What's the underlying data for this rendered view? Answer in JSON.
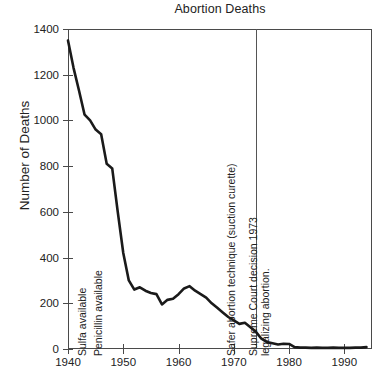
{
  "chart_data": {
    "type": "line",
    "title": "Abortion Deaths",
    "xlabel": "",
    "ylabel": "Number of Deaths",
    "xlim": [
      1940,
      1995
    ],
    "ylim": [
      0,
      1400
    ],
    "grid": false,
    "legend": "none",
    "x_ticks": [
      1940,
      1950,
      1960,
      1970,
      1980,
      1990
    ],
    "x_tick_labels": [
      "1940",
      "1950",
      "1960",
      "1970",
      "1980",
      "1990"
    ],
    "y_ticks": [
      0,
      200,
      400,
      600,
      800,
      1000,
      1200,
      1400
    ],
    "y_tick_labels": [
      "0",
      "200",
      "400",
      "600",
      "800",
      "1000",
      "1200",
      "1400"
    ],
    "series": [
      {
        "name": "Abortion deaths",
        "color": "#1a1a1a",
        "x": [
          1940,
          1941,
          1942,
          1943,
          1944,
          1945,
          1946,
          1947,
          1948,
          1949,
          1950,
          1951,
          1952,
          1953,
          1954,
          1955,
          1956,
          1957,
          1958,
          1959,
          1960,
          1961,
          1962,
          1963,
          1964,
          1965,
          1966,
          1967,
          1968,
          1969,
          1970,
          1971,
          1972,
          1973,
          1974,
          1975,
          1976,
          1977,
          1978,
          1979,
          1980,
          1981,
          1982,
          1983,
          1984,
          1985,
          1986,
          1987,
          1988,
          1989,
          1990,
          1991,
          1992,
          1993,
          1994
        ],
        "values": [
          1350,
          1230,
          1130,
          1025,
          1000,
          960,
          940,
          810,
          790,
          600,
          420,
          300,
          260,
          270,
          255,
          245,
          240,
          195,
          215,
          220,
          240,
          265,
          275,
          255,
          240,
          225,
          200,
          180,
          160,
          140,
          125,
          110,
          115,
          95,
          75,
          45,
          30,
          25,
          20,
          23,
          22,
          8,
          6,
          6,
          5,
          6,
          5,
          5,
          6,
          5,
          5,
          5,
          6,
          6,
          8
        ]
      }
    ],
    "annotations": [
      {
        "id": "sulfa",
        "text": "Sulfa available",
        "x_year": 1943,
        "orientation": "vertical"
      },
      {
        "id": "penicillin",
        "text": "Penicillin available",
        "x_year": 1946,
        "orientation": "vertical"
      },
      {
        "id": "suction-curette",
        "text": "Safer abortion technique (suction curette)",
        "x_year": 1970,
        "orientation": "vertical"
      },
      {
        "id": "roe-v-wade",
        "text": "Supreme Court decision 1973",
        "text_line2": "legalizing abortion.",
        "x_year": 1974,
        "orientation": "vertical",
        "has_event_line": true
      }
    ],
    "event_lines": [
      {
        "id": "roe-v-wade-line",
        "x_year": 1974,
        "color": "#555555"
      }
    ],
    "colors": {
      "line": "#1a1a1a",
      "axis": "#4a4a4a",
      "text": "#222222",
      "background": "#ffffff"
    }
  }
}
